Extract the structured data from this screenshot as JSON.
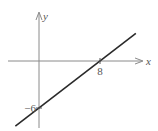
{
  "diagram": {
    "type": "linear-function-graph",
    "axes": {
      "x_label": "x",
      "y_label": "y"
    },
    "line": {
      "x_intercept": 8,
      "y_intercept": -6,
      "slope": 0.75
    },
    "labels": {
      "x_intercept_label": "8",
      "y_intercept_label": "−6"
    },
    "colors": {
      "axis": "#8a8a8a",
      "line": "#2a2a2a"
    }
  }
}
